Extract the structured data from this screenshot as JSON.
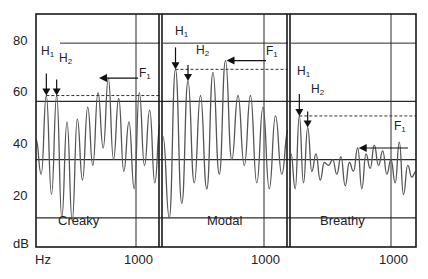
{
  "chart_data": {
    "type": "line",
    "title": "",
    "xlabel": "Hz",
    "ylabel": "dB",
    "ylim": [
      10,
      90
    ],
    "y_ticks": [
      20,
      40,
      60,
      80
    ],
    "y_tick_labels": [
      "20",
      "40",
      "60",
      "80"
    ],
    "y_axis_unit_label": "dB",
    "x_axis_unit_label": "Hz",
    "grid": true,
    "legend": null,
    "panels": [
      {
        "name": "Creaky",
        "x_tick_label": "1000",
        "xlim_hz": [
          0,
          1200
        ],
        "annotations": {
          "H1": {
            "label": "H",
            "sub": "1",
            "x_hz": 100,
            "db": 62
          },
          "H2": {
            "label": "H",
            "sub": "2",
            "x_hz": 200,
            "db": 62
          },
          "F1": {
            "label": "F",
            "sub": "1",
            "x_hz": 600,
            "db": 68
          },
          "dashed_ref_db": 62,
          "solid_ref_db": 80
        },
        "series": [
          {
            "name": "spectrum",
            "x": [
              0,
              50,
              100,
              150,
              200,
              250,
              300,
              350,
              400,
              450,
              500,
              550,
              600,
              650,
              700,
              750,
              800,
              850,
              900,
              950,
              1000,
              1050,
              1100,
              1150,
              1200
            ],
            "values": [
              47,
              35,
              62,
              28,
              62,
              20,
              53,
              19,
              54,
              33,
              58,
              38,
              63,
              44,
              68,
              40,
              61,
              36,
              53,
              30,
              63,
              38,
              57,
              32,
              52
            ]
          }
        ]
      },
      {
        "name": "Modal",
        "x_tick_label": "1000",
        "xlim_hz": [
          0,
          1200
        ],
        "annotations": {
          "H1": {
            "label": "H",
            "sub": "1",
            "x_hz": 120,
            "db": 71
          },
          "H2": {
            "label": "H",
            "sub": "2",
            "x_hz": 240,
            "db": 67
          },
          "F1": {
            "label": "F",
            "sub": "1",
            "x_hz": 600,
            "db": 74
          },
          "dashed_ref_db": 71,
          "solid_ref_db": 80
        },
        "series": [
          {
            "name": "spectrum",
            "x": [
              0,
              60,
              120,
              180,
              240,
              300,
              360,
              420,
              480,
              540,
              600,
              660,
              720,
              780,
              840,
              900,
              960,
              1020,
              1080,
              1140,
              1200
            ],
            "values": [
              48,
              20,
              71,
              25,
              67,
              32,
              62,
              30,
              70,
              35,
              74,
              40,
              62,
              38,
              62,
              32,
              58,
              30,
              55,
              35,
              50
            ]
          }
        ]
      },
      {
        "name": "Breathy",
        "x_tick_label": "1000",
        "xlim_hz": [
          0,
          1200
        ],
        "annotations": {
          "H1": {
            "label": "H",
            "sub": "1",
            "x_hz": 80,
            "db": 55
          },
          "H2": {
            "label": "H",
            "sub": "2",
            "x_hz": 160,
            "db": 51
          },
          "F1": {
            "label": "F",
            "sub": "1",
            "x_hz": 640,
            "db": 44
          },
          "dashed_ref_db": 55,
          "solid_ref_db": 60
        },
        "series": [
          {
            "name": "spectrum",
            "x": [
              0,
              40,
              80,
              120,
              160,
              200,
              240,
              280,
              320,
              360,
              400,
              440,
              480,
              520,
              560,
              600,
              640,
              680,
              720,
              760,
              800,
              840,
              880,
              920,
              960,
              1000,
              1040,
              1080,
              1120,
              1160,
              1200
            ],
            "values": [
              42,
              30,
              55,
              32,
              51,
              36,
              42,
              33,
              39,
              38,
              40,
              35,
              41,
              31,
              39,
              36,
              44,
              30,
              42,
              37,
              45,
              38,
              43,
              35,
              40,
              32,
              46,
              28,
              38,
              34,
              36
            ]
          }
        ]
      }
    ]
  },
  "axis": {
    "y_labels": [
      "80",
      "60",
      "40",
      "20"
    ],
    "y_unit": "dB",
    "x_unit": "Hz"
  },
  "panels": [
    {
      "label": "Creaky",
      "x_tick": "1000"
    },
    {
      "label": "Modal",
      "x_tick": "1000"
    },
    {
      "label": "Breathy",
      "x_tick": "1000"
    }
  ],
  "annotations": {
    "h1_main": "H",
    "h1_sub": "1",
    "h2_main": "H",
    "h2_sub": "2",
    "f1_main": "F",
    "f1_sub": "1"
  },
  "colors": {
    "frame": "#1a1a1a",
    "grid": "#2a2a2a",
    "trace": "#555555",
    "text": "#222222"
  }
}
